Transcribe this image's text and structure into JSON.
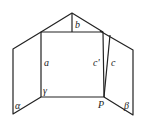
{
  "diagram": {
    "type": "geometry-figure",
    "labels": {
      "a": "a",
      "b": "b",
      "c": "c",
      "c_prime": "c'",
      "alpha": "α",
      "beta": "β",
      "gamma": "γ",
      "P": "P"
    },
    "colors": {
      "stroke": "#222222",
      "background": "#ffffff"
    }
  }
}
